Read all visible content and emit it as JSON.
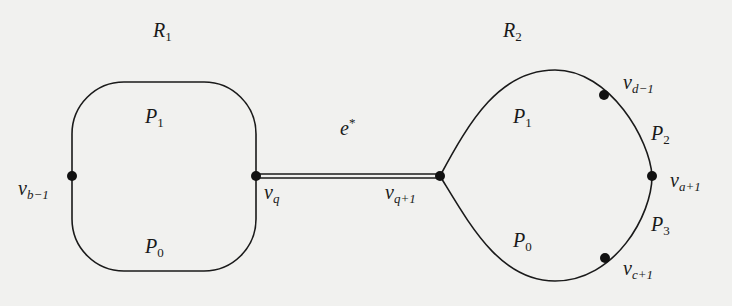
{
  "diagram": {
    "regions": [
      {
        "id": "R1",
        "base": "R",
        "sub": "1"
      },
      {
        "id": "R2",
        "base": "R",
        "sub": "2"
      }
    ],
    "edge": {
      "base": "e",
      "sup": "*"
    },
    "left_shape": {
      "paths": [
        {
          "base": "P",
          "sub": "1"
        },
        {
          "base": "P",
          "sub": "0"
        }
      ],
      "vertices": [
        {
          "base": "v",
          "sub": "b−1"
        },
        {
          "base": "v",
          "sub": "q"
        }
      ]
    },
    "right_shape": {
      "paths": [
        {
          "base": "P",
          "sub": "1"
        },
        {
          "base": "P",
          "sub": "0"
        },
        {
          "base": "P",
          "sub": "2"
        },
        {
          "base": "P",
          "sub": "3"
        }
      ],
      "vertices": [
        {
          "base": "v",
          "sub": "q+1"
        },
        {
          "base": "v",
          "sub": "d−1"
        },
        {
          "base": "v",
          "sub": "a+1"
        },
        {
          "base": "v",
          "sub": "c+1"
        }
      ]
    },
    "colors": {
      "stroke": "#1a1a1a",
      "background": "#f1f1ef"
    }
  }
}
